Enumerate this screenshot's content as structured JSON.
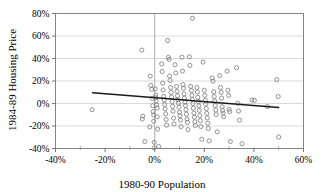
{
  "chart_data": {
    "type": "scatter",
    "title": "",
    "xlabel": "1980-90 Population",
    "ylabel": "1984-89 Housing Price",
    "xlim": [
      -0.4,
      0.6
    ],
    "ylim": [
      -0.4,
      0.8
    ],
    "xtick_values": [
      -0.4,
      -0.2,
      0,
      0.2,
      0.4,
      0.6
    ],
    "xtick_labels": [
      "-40%",
      "-20%",
      "0%",
      "20%",
      "40%",
      "60%"
    ],
    "xtick_minor_values": [
      -0.3,
      -0.1,
      0.1,
      0.3,
      0.5
    ],
    "ytick_values": [
      -0.4,
      -0.2,
      0,
      0.2,
      0.4,
      0.6,
      0.8
    ],
    "ytick_labels": [
      "-40%",
      "-20%",
      "0%",
      "20%",
      "40%",
      "60%",
      "80%"
    ],
    "grid": "horizontal",
    "legend": "none",
    "marker": "open-circle",
    "marker_color": "#808080",
    "reference_lines": [
      {
        "name": "vertical-zero-line",
        "orientation": "vertical",
        "value": 0.0,
        "color": "#999999"
      }
    ],
    "trendline": {
      "name": "linear-trend",
      "color": "#1a1a1a",
      "x_start": -0.25,
      "y_start": 0.095,
      "x_end": 0.5,
      "y_end": -0.035
    },
    "points": [
      [
        -0.252,
        -0.055
      ],
      [
        -0.052,
        0.475
      ],
      [
        -0.048,
        -0.112
      ],
      [
        -0.05,
        -0.138
      ],
      [
        -0.04,
        -0.338
      ],
      [
        -0.018,
        0.243
      ],
      [
        -0.016,
        0.161
      ],
      [
        -0.02,
        -0.208
      ],
      [
        -0.012,
        0.125
      ],
      [
        -0.01,
        0.045
      ],
      [
        -0.008,
        -0.02
      ],
      [
        -0.006,
        -0.072
      ],
      [
        -0.004,
        -0.102
      ],
      [
        -0.004,
        -0.158
      ],
      [
        -0.002,
        -0.345
      ],
      [
        -0.002,
        -0.395
      ],
      [
        0.002,
        0.131
      ],
      [
        0.004,
        0.075
      ],
      [
        0.004,
        0.052
      ],
      [
        0.006,
        0.022
      ],
      [
        0.008,
        -0.012
      ],
      [
        0.01,
        -0.04
      ],
      [
        0.01,
        -0.118
      ],
      [
        0.012,
        -0.228
      ],
      [
        0.016,
        -0.382
      ],
      [
        0.028,
        0.352
      ],
      [
        0.03,
        0.284
      ],
      [
        0.032,
        0.18
      ],
      [
        0.034,
        0.12
      ],
      [
        0.036,
        0.062
      ],
      [
        0.038,
        0.03
      ],
      [
        0.04,
        -0.008
      ],
      [
        0.042,
        -0.048
      ],
      [
        0.044,
        -0.092
      ],
      [
        0.046,
        -0.142
      ],
      [
        0.048,
        -0.192
      ],
      [
        0.052,
        0.56
      ],
      [
        0.055,
        0.41
      ],
      [
        0.058,
        0.392
      ],
      [
        0.06,
        0.244
      ],
      [
        0.062,
        0.205
      ],
      [
        0.064,
        0.142
      ],
      [
        0.066,
        0.098
      ],
      [
        0.068,
        0.058
      ],
      [
        0.07,
        0.018
      ],
      [
        0.072,
        -0.025
      ],
      [
        0.074,
        -0.068
      ],
      [
        0.076,
        -0.13
      ],
      [
        0.078,
        -0.182
      ],
      [
        0.082,
        0.345
      ],
      [
        0.085,
        0.272
      ],
      [
        0.088,
        0.152
      ],
      [
        0.09,
        0.108
      ],
      [
        0.092,
        0.068
      ],
      [
        0.094,
        0.032
      ],
      [
        0.096,
        0.002
      ],
      [
        0.098,
        -0.032
      ],
      [
        0.1,
        -0.078
      ],
      [
        0.102,
        -0.108
      ],
      [
        0.104,
        -0.148
      ],
      [
        0.106,
        -0.205
      ],
      [
        0.11,
        0.412
      ],
      [
        0.112,
        0.288
      ],
      [
        0.114,
        0.168
      ],
      [
        0.116,
        0.135
      ],
      [
        0.118,
        0.085
      ],
      [
        0.12,
        0.048
      ],
      [
        0.122,
        0.012
      ],
      [
        0.124,
        -0.018
      ],
      [
        0.126,
        -0.055
      ],
      [
        0.128,
        -0.095
      ],
      [
        0.13,
        -0.138
      ],
      [
        0.132,
        -0.168
      ],
      [
        0.134,
        -0.232
      ],
      [
        0.14,
        0.415
      ],
      [
        0.142,
        0.338
      ],
      [
        0.145,
        0.152
      ],
      [
        0.148,
        0.115
      ],
      [
        0.15,
        0.072
      ],
      [
        0.152,
        0.035
      ],
      [
        0.154,
        0.0
      ],
      [
        0.156,
        -0.042
      ],
      [
        0.158,
        -0.085
      ],
      [
        0.16,
        -0.122
      ],
      [
        0.162,
        -0.162
      ],
      [
        0.164,
        -0.195
      ],
      [
        0.152,
        0.758
      ],
      [
        0.17,
        0.142
      ],
      [
        0.172,
        0.102
      ],
      [
        0.174,
        0.055
      ],
      [
        0.176,
        0.018
      ],
      [
        0.178,
        -0.022
      ],
      [
        0.18,
        -0.062
      ],
      [
        0.182,
        -0.108
      ],
      [
        0.184,
        -0.152
      ],
      [
        0.186,
        -0.205
      ],
      [
        0.19,
        -0.318
      ],
      [
        0.195,
        0.368
      ],
      [
        0.2,
        0.118
      ],
      [
        0.202,
        0.072
      ],
      [
        0.204,
        0.028
      ],
      [
        0.206,
        -0.005
      ],
      [
        0.208,
        -0.045
      ],
      [
        0.21,
        -0.088
      ],
      [
        0.212,
        -0.128
      ],
      [
        0.214,
        -0.175
      ],
      [
        0.216,
        -0.222
      ],
      [
        0.22,
        -0.332
      ],
      [
        0.232,
        0.228
      ],
      [
        0.235,
        0.198
      ],
      [
        0.238,
        0.105
      ],
      [
        0.24,
        0.062
      ],
      [
        0.242,
        0.022
      ],
      [
        0.244,
        -0.018
      ],
      [
        0.246,
        -0.058
      ],
      [
        0.248,
        -0.098
      ],
      [
        0.252,
        -0.252
      ],
      [
        0.262,
        0.248
      ],
      [
        0.265,
        0.142
      ],
      [
        0.268,
        0.098
      ],
      [
        0.27,
        0.048
      ],
      [
        0.272,
        -0.028
      ],
      [
        0.274,
        -0.062
      ],
      [
        0.276,
        -0.085
      ],
      [
        0.278,
        -0.118
      ],
      [
        0.292,
        0.288
      ],
      [
        0.295,
        0.118
      ],
      [
        0.298,
        0.072
      ],
      [
        0.3,
        -0.052
      ],
      [
        0.302,
        -0.072
      ],
      [
        0.305,
        -0.338
      ],
      [
        0.33,
        0.318
      ],
      [
        0.335,
        0.002
      ],
      [
        0.338,
        -0.068
      ],
      [
        0.342,
        -0.148
      ],
      [
        0.352,
        -0.358
      ],
      [
        0.392,
        0.032
      ],
      [
        0.402,
        0.028
      ],
      [
        0.455,
        -0.028
      ],
      [
        0.492,
        0.212
      ],
      [
        0.498,
        0.062
      ],
      [
        0.5,
        -0.298
      ]
    ]
  }
}
